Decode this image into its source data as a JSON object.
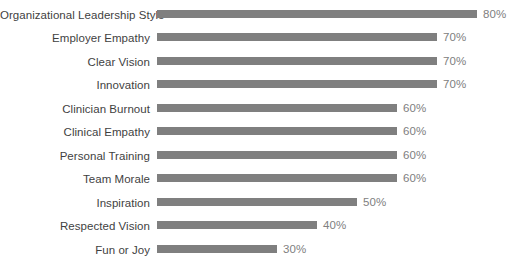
{
  "chart_data": {
    "type": "bar",
    "orientation": "horizontal",
    "title": "",
    "subtitle": "",
    "xlabel": "",
    "ylabel": "",
    "grid": false,
    "legend": "none",
    "xlim": [
      0,
      80
    ],
    "value_suffix": "%",
    "categories": [
      "Organizational Leadership Style",
      "Employer Empathy",
      "Clear Vision",
      "Innovation",
      "Clinician Burnout",
      "Clinical Empathy",
      "Personal Training",
      "Team Morale",
      "Inspiration",
      "Respected Vision",
      "Fun or Joy"
    ],
    "values": [
      80,
      70,
      70,
      70,
      60,
      60,
      60,
      60,
      50,
      40,
      30
    ],
    "data_labels": [
      "80%",
      "70%",
      "70%",
      "70%",
      "60%",
      "60%",
      "60%",
      "60%",
      "50%",
      "40%",
      "30%"
    ],
    "colors": {
      "bar": "#7f7f7f",
      "category_label": "#3f3f3f",
      "value_label": "#808080",
      "background": "#ffffff"
    }
  }
}
